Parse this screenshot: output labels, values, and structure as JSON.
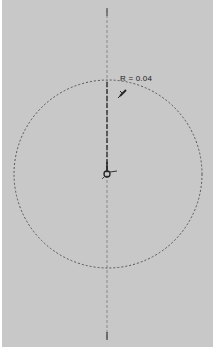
{
  "sketch": {
    "radius_label": "R = 0.04",
    "axis": {
      "x": 105,
      "y_top": 12,
      "y_bottom": 338
    },
    "circle": {
      "cx": 106,
      "cy": 174,
      "r": 94
    },
    "colors": {
      "background": "#c8c8c8",
      "line": "#555555",
      "radius_line": "#333333"
    },
    "icons": {
      "cursor": "pen-cursor-icon",
      "center": "center-point-icon"
    }
  }
}
